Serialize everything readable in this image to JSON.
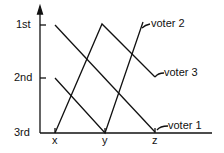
{
  "y_axis": {
    "ticks": [
      {
        "label": "1st",
        "y": 25
      },
      {
        "label": "2nd",
        "y": 78
      },
      {
        "label": "3rd",
        "y": 133
      }
    ]
  },
  "x_axis": {
    "ticks": [
      {
        "label": "x",
        "x": 55
      },
      {
        "label": "y",
        "x": 105
      },
      {
        "label": "z",
        "x": 155
      }
    ]
  },
  "voters": [
    {
      "label": "voter 1",
      "ranks": {
        "x": "1st",
        "y": "2nd",
        "z": "3rd"
      }
    },
    {
      "label": "voter 2",
      "ranks": {
        "x": "2nd",
        "y": "3rd",
        "z": "1st"
      }
    },
    {
      "label": "voter 3",
      "ranks": {
        "x": "3rd",
        "y": "1st",
        "z": "2nd"
      }
    }
  ]
}
